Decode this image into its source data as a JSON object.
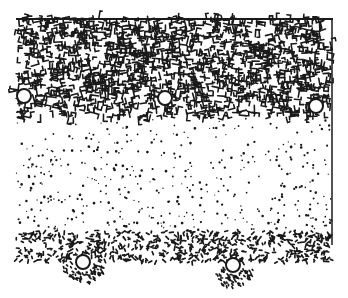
{
  "figure": {
    "type": "stippled cross-section illustration",
    "colors": {
      "ink": "#1a1a1a",
      "paper": "#ffffff"
    },
    "layers": [
      {
        "name": "dense-maze-layer",
        "top": 18,
        "bottom": 118
      },
      {
        "name": "sparse-dot-layer",
        "top": 118,
        "bottom": 230
      },
      {
        "name": "dense-dot-layer",
        "top": 230,
        "bottom": 262
      }
    ],
    "upper_circles": [
      {
        "x": 24,
        "y": 96,
        "r": 7
      },
      {
        "x": 165,
        "y": 98,
        "r": 7
      },
      {
        "x": 316,
        "y": 106,
        "r": 7
      }
    ],
    "lower_circles": [
      {
        "x": 83,
        "y": 262,
        "r": 7
      },
      {
        "x": 233,
        "y": 265,
        "r": 7
      }
    ]
  }
}
